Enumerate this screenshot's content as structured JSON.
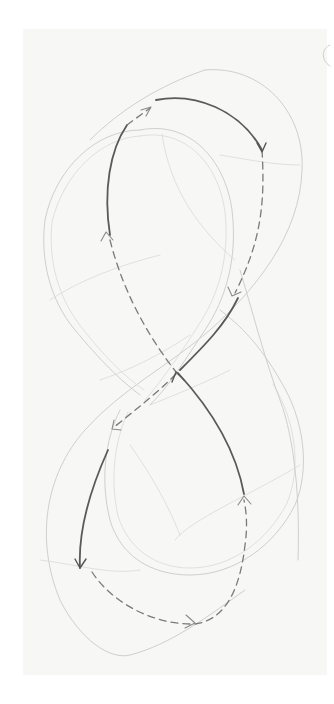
{
  "figure": {
    "kind": "pencil-sketch",
    "colors": {
      "background": "#ffffff",
      "paper": "#f7f7f6",
      "construction_line": "#cfcfcf",
      "solid_stroke": "#5a5a5a",
      "dashed_stroke": "#7a7a7a"
    }
  },
  "paths": {
    "outer_band_outer": "M 205 70 C 260 65 305 110 302 170 C 300 235 255 290 210 330 C 170 365 120 390 85 430 C 45 475 35 540 60 600 C 80 640 110 660 130 655 C 170 645 210 615 245 590",
    "outer_band_upper_left": "M 205 70 C 160 85 120 110 90 140",
    "left_loop_outer": "M 140 130 C 95 130 55 170 45 220 C 40 260 50 300 75 330 C 100 360 120 380 140 395",
    "left_loop_inner": "M 140 136 C 100 138 63 175 52 222 C 48 260 58 298 82 328 C 104 356 124 376 144 390",
    "upper_inner_outer": "M 140 130 C 190 120 225 160 232 210 C 238 260 225 300 205 330 C 185 360 170 385 150 405",
    "upper_inner_inner": "M 140 136 C 186 128 219 165 225 212 C 230 258 218 296 198 326 C 180 354 164 378 145 400",
    "lower_loop_outer": "M 120 410 C 105 440 100 480 110 520 C 120 555 150 575 190 575 C 235 575 275 545 295 505 C 310 470 305 420 280 380 C 260 345 240 325 220 310",
    "lower_loop_inner": "M 128 412 C 114 442 110 480 118 516 C 128 548 155 568 190 568 C 232 568 268 540 287 503 C 301 470 297 423 273 384",
    "construction_1": "M 162 134 C 170 190 200 230 235 260",
    "construction_2": "M 220 155 C 250 160 275 165 300 165",
    "construction_3": "M 50 300 C 80 280 120 265 160 255",
    "construction_4": "M 240 270 C 255 320 265 360 280 400 C 295 440 300 500 298 560",
    "construction_5": "M 40 560 C 80 565 110 575 140 570",
    "construction_6": "M 175 540 C 190 520 250 495 300 465",
    "construction_7": "M 130 445 C 155 480 170 510 180 535",
    "construction_8": "M 100 380 C 130 370 160 355 190 335",
    "construction_9": "M 150 405 C 175 395 200 385 230 370",
    "solid_top_arc": "M 156 100 C 195 92 240 110 262 150",
    "solid_left_upper": "M 127 125 C 110 150 103 190 110 235",
    "solid_center_rise": "M 238 298 C 225 325 205 345 180 370",
    "solid_center_up": "M 244 494 C 236 450 212 410 178 373",
    "solid_lower_left": "M 108 450 C 90 490 78 530 80 568",
    "dashed_top_start": "M 127 125 L 150 108",
    "dashed_right_down": "M 262 150 C 265 200 262 240 235 293",
    "dashed_left_down": "M 110 240 C 125 300 155 345 176 372",
    "dashed_center_down": "M 176 374 C 155 395 135 410 113 428",
    "dashed_bottom": "M 92 572 C 110 600 150 625 195 624 C 225 620 240 590 245 545 C 248 525 246 510 244 500",
    "arrow_top_start": "M 141 110 L 151 107 L 146 116",
    "arrow_right_top": "M 257 143 L 262 152 L 266 143",
    "arrow_right_mid": "M 228 287 L 232 296 L 241 292",
    "arrow_left_up": "M 101 241 L 106 232 L 113 240",
    "arrow_center_up": "M 172 382 L 176 372 L 184 380",
    "arrow_center_down": "M 114 420 L 112 429 L 121 430",
    "arrow_lower_left": "M 75 559 L 80 568 L 86 559",
    "arrow_bottom": "M 186 615 L 195 623 L 185 628",
    "arrow_bottom_right": "M 238 505 L 244 496 L 251 504",
    "corner_mark": "M 330 45 C 322 48 320 60 330 66"
  }
}
